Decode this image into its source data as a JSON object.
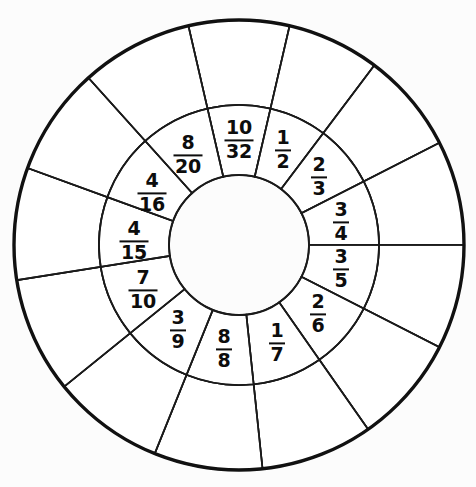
{
  "figure": {
    "name": "fraction-wheel",
    "background_color": "#fcfcfc",
    "line_color": "#1a1a1a",
    "outer_line_color": "#111111",
    "fill_color": "#ffffff"
  },
  "geometry": {
    "center_x": 239,
    "center_y": 245,
    "hub_radius": 70,
    "inner_ring_outer_radius": 140,
    "outer_ring_outer_radius": 225,
    "label_radius": 105,
    "sector_count": 13
  },
  "chart_data": {
    "type": "pie",
    "title": "",
    "xlabel": "",
    "ylabel": "",
    "legend": "none",
    "grid": false,
    "categories": [
      "10/32",
      "1/2",
      "2/3",
      "3/4",
      "3/5",
      "2/6",
      "1/7",
      "8/8",
      "3/9",
      "7/10",
      "4/15",
      "4/16",
      "8/20"
    ],
    "values": [
      26,
      24,
      26,
      27,
      27,
      28,
      29,
      28,
      29,
      30,
      29,
      28,
      29
    ],
    "annotations": [
      "Inner ring sectors are labeled with fractions",
      "Outer ring sectors are blank",
      "Center hub is blank"
    ]
  },
  "sectors": [
    {
      "id": "sector-10-32",
      "numerator": "10",
      "denominator": "32",
      "start_deg": -103,
      "end_deg": -77,
      "label_angle_deg": -90,
      "label_x": 239,
      "label_y": 140
    },
    {
      "id": "sector-1-2",
      "numerator": "1",
      "denominator": "2",
      "start_deg": -77,
      "end_deg": -53,
      "label_angle_deg": -65,
      "label_x": 283,
      "label_y": 150
    },
    {
      "id": "sector-2-3",
      "numerator": "2",
      "denominator": "3",
      "start_deg": -53,
      "end_deg": -27,
      "label_angle_deg": -40,
      "label_x": 319,
      "label_y": 177
    },
    {
      "id": "sector-3-4",
      "numerator": "3",
      "denominator": "4",
      "start_deg": -27,
      "end_deg": 0,
      "label_angle_deg": -13,
      "label_x": 341,
      "label_y": 222
    },
    {
      "id": "sector-3-5",
      "numerator": "3",
      "denominator": "5",
      "start_deg": 0,
      "end_deg": 27,
      "label_angle_deg": 13,
      "label_x": 341,
      "label_y": 269
    },
    {
      "id": "sector-2-6",
      "numerator": "2",
      "denominator": "6",
      "start_deg": 27,
      "end_deg": 55,
      "label_angle_deg": 41,
      "label_x": 318,
      "label_y": 314
    },
    {
      "id": "sector-1-7",
      "numerator": "1",
      "denominator": "7",
      "start_deg": 55,
      "end_deg": 84,
      "label_angle_deg": 69,
      "label_x": 277,
      "label_y": 343
    },
    {
      "id": "sector-8-8",
      "numerator": "8",
      "denominator": "8",
      "start_deg": 84,
      "end_deg": 112,
      "label_angle_deg": 98,
      "label_x": 224,
      "label_y": 349
    },
    {
      "id": "sector-3-9",
      "numerator": "3",
      "denominator": "9",
      "start_deg": 112,
      "end_deg": 141,
      "label_angle_deg": 126,
      "label_x": 178,
      "label_y": 330
    },
    {
      "id": "sector-7-10",
      "numerator": "7",
      "denominator": "10",
      "start_deg": 141,
      "end_deg": 171,
      "label_angle_deg": 156,
      "label_x": 143,
      "label_y": 290
    },
    {
      "id": "sector-4-15",
      "numerator": "4",
      "denominator": "15",
      "start_deg": 171,
      "end_deg": 200,
      "label_angle_deg": 185,
      "label_x": 134,
      "label_y": 241
    },
    {
      "id": "sector-4-16",
      "numerator": "4",
      "denominator": "16",
      "start_deg": 200,
      "end_deg": 228,
      "label_angle_deg": 214,
      "label_x": 152,
      "label_y": 193
    },
    {
      "id": "sector-8-20",
      "numerator": "8",
      "denominator": "20",
      "start_deg": 228,
      "end_deg": 257,
      "label_angle_deg": 243,
      "label_x": 188,
      "label_y": 155
    }
  ]
}
